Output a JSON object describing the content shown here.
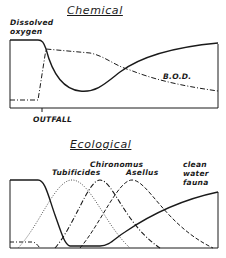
{
  "chemical": {
    "title": "Chemical",
    "y_label_line1": "Dissolved",
    "y_label_line2": "oxygen",
    "bod_label": "B.O.D.",
    "x_marker_label": "OUTFALL",
    "series": [
      {
        "name": "Dissolved oxygen",
        "style": "solid"
      },
      {
        "name": "B.O.D.",
        "style": "dash-dot"
      }
    ]
  },
  "ecological": {
    "title": "Ecological",
    "labels": {
      "tubificides": "Tubificides",
      "chironomus": "Chironomus",
      "asellus": "Asellus",
      "clean_line1": "clean",
      "clean_line2": "water",
      "clean_line3": "fauna"
    },
    "series": [
      {
        "name": "Algae / initial fauna",
        "style": "solid"
      },
      {
        "name": "Tubificides",
        "style": "dotted"
      },
      {
        "name": "Chironomus",
        "style": "dash-dot"
      },
      {
        "name": "Asellus",
        "style": "dashed"
      },
      {
        "name": "clean water fauna",
        "style": "solid"
      }
    ]
  }
}
